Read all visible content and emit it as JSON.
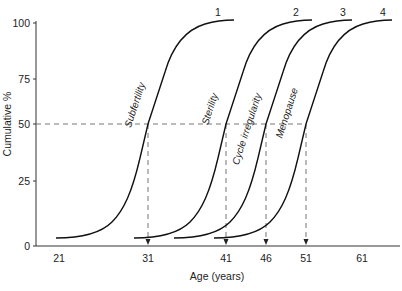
{
  "chart_data": {
    "type": "line",
    "title": "",
    "xlabel": "Age (years)",
    "ylabel": "Cumulative %",
    "ylim": [
      0,
      100
    ],
    "grid": false,
    "legend": "none (curves numbered 1-4 at top, labelled along curves)",
    "y_ticks": [
      0,
      25,
      50,
      75,
      100
    ],
    "x_ticks": [
      "21",
      "31",
      "41",
      "46",
      "51",
      "61"
    ],
    "reference_line": {
      "y": 50,
      "style": "dashed",
      "drops_to_x": [
        "31",
        "41",
        "46",
        "51"
      ]
    },
    "series": [
      {
        "id": "1",
        "name": "Subfertility",
        "age_at_50_percent": 31,
        "start_age": 21,
        "start_value": 3,
        "end_value": 100
      },
      {
        "id": "2",
        "name": "Sterility",
        "age_at_50_percent": 41,
        "start_value": 3,
        "end_value": 100
      },
      {
        "id": "3",
        "name": "Cycle irregularity",
        "age_at_50_percent": 46,
        "start_value": 3,
        "end_value": 100
      },
      {
        "id": "4",
        "name": "Menopause",
        "age_at_50_percent": 51,
        "start_value": 3,
        "end_value": 100
      }
    ]
  },
  "axes": {
    "y_label": "Cumulative %",
    "x_label": "Age (years)",
    "y_ticks": [
      {
        "label": "100",
        "y": 23
      },
      {
        "label": "75",
        "y": 79
      },
      {
        "label": "50",
        "y": 124
      },
      {
        "label": "25",
        "y": 181
      },
      {
        "label": "0",
        "y": 246
      }
    ],
    "x_ticks": [
      {
        "label": "21",
        "x": 59
      },
      {
        "label": "31",
        "x": 148
      },
      {
        "label": "41",
        "x": 226
      },
      {
        "label": "46",
        "x": 266
      },
      {
        "label": "51",
        "x": 306
      },
      {
        "label": "61",
        "x": 362
      }
    ]
  },
  "curves": [
    {
      "number": "1",
      "label": "Subfertility",
      "shift": 0,
      "num_x": 218,
      "label_x": 138,
      "label_y": 106
    },
    {
      "number": "2",
      "label": "Sterility",
      "shift": 78,
      "num_x": 296,
      "label_x": 213,
      "label_y": 110
    },
    {
      "number": "3",
      "label": "Cycle irregularity",
      "shift": 118,
      "num_x": 343,
      "label_x": 250,
      "label_y": 130
    },
    {
      "number": "4",
      "label": "Menopause",
      "shift": 158,
      "num_x": 383,
      "label_x": 290,
      "label_y": 114
    }
  ],
  "colors": {
    "line": "#111111",
    "dash": "#666666",
    "text": "#222222"
  }
}
